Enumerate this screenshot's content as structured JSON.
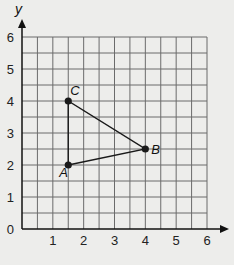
{
  "chart_data": {
    "type": "scatter",
    "title": "",
    "xlabel": "",
    "ylabel": "y",
    "xlim": [
      0,
      6
    ],
    "ylim": [
      0,
      6
    ],
    "grid": true,
    "grid_step": 0.5,
    "x_ticks": [
      "1",
      "2",
      "3",
      "4",
      "5",
      "6"
    ],
    "y_ticks": [
      "0",
      "1",
      "2",
      "3",
      "4",
      "5",
      "6"
    ],
    "points": [
      {
        "label": "A",
        "x": 1.5,
        "y": 2
      },
      {
        "label": "B",
        "x": 4,
        "y": 2.5
      },
      {
        "label": "C",
        "x": 1.5,
        "y": 4
      }
    ],
    "polygon": [
      "A",
      "B",
      "C"
    ],
    "colors": {
      "background": "#ededeb",
      "grid": "#6b6b6b",
      "axis": "#111111",
      "shape": "#1a1a1a"
    }
  }
}
